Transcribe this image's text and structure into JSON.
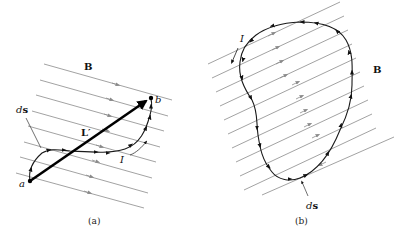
{
  "panel_a": {
    "field_label": "B",
    "point_start": "a",
    "point_end": "b",
    "segment_label": "L′",
    "element_label_italic": "d",
    "element_label_bold": "s",
    "current_label": "I",
    "caption": "(a)"
  },
  "panel_b": {
    "field_label": "B",
    "current_label": "I",
    "element_label_italic": "d",
    "element_label_bold": "s",
    "caption": "(b)"
  },
  "colors": {
    "field_lines": "#8a8a8a",
    "wire": "#000000",
    "background": "#ffffff"
  }
}
